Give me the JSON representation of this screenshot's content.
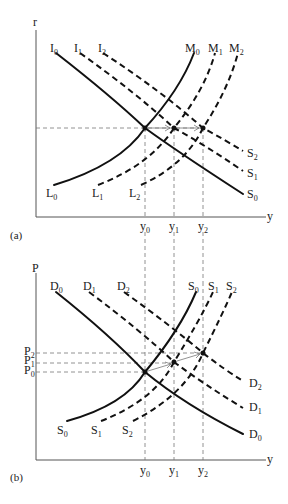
{
  "figure": {
    "panels": [
      {
        "id": "a",
        "label": "(a)",
        "y_axis_label": "r",
        "x_axis_label": "y",
        "curves": {
          "I0": {
            "base": "I",
            "sub": "0"
          },
          "I1": {
            "base": "I",
            "sub": "1"
          },
          "I2": {
            "base": "I",
            "sub": "2"
          },
          "M0": {
            "base": "M",
            "sub": "0"
          },
          "M1": {
            "base": "M",
            "sub": "1"
          },
          "M2": {
            "base": "M",
            "sub": "2"
          },
          "L0": {
            "base": "L",
            "sub": "0"
          },
          "L1": {
            "base": "L",
            "sub": "1"
          },
          "L2": {
            "base": "L",
            "sub": "2"
          },
          "S0": {
            "base": "S",
            "sub": "0"
          },
          "S1": {
            "base": "S",
            "sub": "1"
          },
          "S2": {
            "base": "S",
            "sub": "2"
          }
        },
        "x_ticks": [
          {
            "base": "y",
            "sub": "0"
          },
          {
            "base": "y",
            "sub": "1"
          },
          {
            "base": "y",
            "sub": "2"
          }
        ]
      },
      {
        "id": "b",
        "label": "(b)",
        "y_axis_label": "P",
        "x_axis_label": "y",
        "curves": {
          "D0": {
            "base": "D",
            "sub": "0"
          },
          "D1": {
            "base": "D",
            "sub": "1"
          },
          "D2": {
            "base": "D",
            "sub": "2"
          },
          "S0": {
            "base": "S",
            "sub": "0"
          },
          "S1": {
            "base": "S",
            "sub": "1"
          },
          "S2": {
            "base": "S",
            "sub": "2"
          }
        },
        "y_ticks": [
          {
            "base": "P",
            "sub": "2"
          },
          {
            "base": "P",
            "sub": "1"
          },
          {
            "base": "P",
            "sub": "0"
          }
        ],
        "x_ticks": [
          {
            "base": "y",
            "sub": "0"
          },
          {
            "base": "y",
            "sub": "1"
          },
          {
            "base": "y",
            "sub": "2"
          }
        ]
      }
    ]
  }
}
